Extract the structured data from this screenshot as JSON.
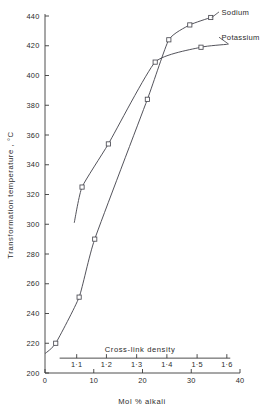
{
  "chart_data": {
    "type": "line",
    "title": "",
    "xlabel": "Mol % alkali",
    "ylabel": "Transformation temperature , °C",
    "secondary_xlabel": "Cross-link density",
    "xlim": [
      0,
      40
    ],
    "ylim": [
      200,
      440
    ],
    "grid": false,
    "legend_position": "right-inline-labels",
    "x_ticks": [
      {
        "value": 0,
        "label": "0"
      },
      {
        "value": 10,
        "label": "10"
      },
      {
        "value": 20,
        "label": "20"
      },
      {
        "value": 30,
        "label": "30"
      },
      {
        "value": 40,
        "label": "40"
      }
    ],
    "y_ticks": [
      {
        "value": 440,
        "label": "440"
      },
      {
        "value": 420,
        "label": "420"
      },
      {
        "value": 400,
        "label": "400"
      },
      {
        "value": 380,
        "label": "380"
      },
      {
        "value": 360,
        "label": "360"
      },
      {
        "value": 340,
        "label": "340"
      },
      {
        "value": 320,
        "label": "320"
      },
      {
        "value": 300,
        "label": "300"
      },
      {
        "value": 280,
        "label": "280"
      },
      {
        "value": 260,
        "label": "260"
      },
      {
        "value": 240,
        "label": "240"
      },
      {
        "value": 220,
        "label": "220"
      },
      {
        "value": 200,
        "label": "200"
      }
    ],
    "secondary_axis": {
      "label": "Cross-link density",
      "y_value": 210,
      "x_start": 3.0,
      "x_end": 38.0,
      "ticks": [
        {
          "mol": 6.5,
          "label": "1·1"
        },
        {
          "mol": 12.6,
          "label": "1·2"
        },
        {
          "mol": 18.8,
          "label": "1·3"
        },
        {
          "mol": 25.0,
          "label": "1·4"
        },
        {
          "mol": 31.2,
          "label": "1·5"
        },
        {
          "mol": 37.3,
          "label": "1·6"
        }
      ]
    },
    "series": [
      {
        "name": "Sodium",
        "label": "Sodium",
        "color": "#4a4a52",
        "label_anchor": {
          "x": 36.0,
          "y": 441
        },
        "points": [
          {
            "x": 0.0,
            "y": 213
          },
          {
            "x": 2.2,
            "y": 220
          },
          {
            "x": 7.0,
            "y": 251
          },
          {
            "x": 10.2,
            "y": 290
          },
          {
            "x": 21.0,
            "y": 384
          },
          {
            "x": 25.4,
            "y": 424
          },
          {
            "x": 29.7,
            "y": 434
          },
          {
            "x": 34.0,
            "y": 439
          }
        ],
        "markers": [
          {
            "x": 2.2,
            "y": 220
          },
          {
            "x": 7.0,
            "y": 251
          },
          {
            "x": 10.2,
            "y": 290
          },
          {
            "x": 21.0,
            "y": 384
          },
          {
            "x": 25.4,
            "y": 424
          },
          {
            "x": 29.7,
            "y": 434
          },
          {
            "x": 34.0,
            "y": 439
          }
        ]
      },
      {
        "name": "Potassium",
        "label": "Potassium",
        "color": "#4a4a52",
        "label_anchor": {
          "x": 36.0,
          "y": 424
        },
        "points": [
          {
            "x": 6.0,
            "y": 301
          },
          {
            "x": 7.6,
            "y": 325
          },
          {
            "x": 13.0,
            "y": 354
          },
          {
            "x": 22.6,
            "y": 409
          },
          {
            "x": 32.0,
            "y": 419
          },
          {
            "x": 37.5,
            "y": 421
          }
        ],
        "markers": [
          {
            "x": 7.6,
            "y": 325
          },
          {
            "x": 13.0,
            "y": 354
          },
          {
            "x": 22.6,
            "y": 409
          },
          {
            "x": 32.0,
            "y": 419
          }
        ]
      }
    ]
  }
}
